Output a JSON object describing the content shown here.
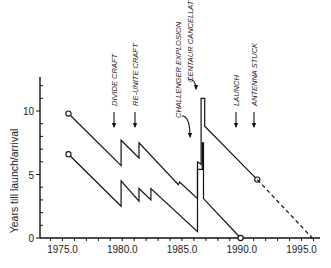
{
  "chart_data": {
    "type": "line",
    "title": "",
    "xlabel": "",
    "ylabel": "Years till launch/arrival",
    "xlim": [
      1973.5,
      1997.0
    ],
    "ylim": [
      0,
      12
    ],
    "x_ticks": [
      "1975.0",
      "1980.0",
      "1985.0",
      "1990.0",
      "1995.0"
    ],
    "x_tick_values": [
      1975,
      1980,
      1985,
      1990,
      1995
    ],
    "y_ticks": [
      "0",
      "5",
      "10"
    ],
    "y_tick_values": [
      0,
      5,
      10
    ],
    "grid": false,
    "legend": null,
    "series": [
      {
        "name": "upper (years till arrival)",
        "style": "solid",
        "points": [
          [
            1975.5,
            9.8
          ],
          [
            1979.9,
            5.7
          ],
          [
            1979.9,
            7.7
          ],
          [
            1981.4,
            6.3
          ],
          [
            1981.4,
            7.5
          ],
          [
            1984.7,
            4.2
          ],
          [
            1984.8,
            4.4
          ],
          [
            1986.3,
            3.1
          ],
          [
            1986.3,
            6.0
          ],
          [
            1986.6,
            5.8
          ],
          [
            1986.6,
            11.0
          ],
          [
            1986.9,
            11.0
          ],
          [
            1986.9,
            8.8
          ],
          [
            1991.3,
            4.6
          ]
        ],
        "markers": [
          [
            1975.5,
            9.8
          ],
          [
            1991.3,
            4.6
          ]
        ]
      },
      {
        "name": "upper projection",
        "style": "dashed",
        "points": [
          [
            1991.3,
            4.6
          ],
          [
            1995.9,
            0.0
          ]
        ]
      },
      {
        "name": "lower (years till launch)",
        "style": "solid",
        "points": [
          [
            1975.5,
            6.6
          ],
          [
            1979.9,
            2.5
          ],
          [
            1979.9,
            4.5
          ],
          [
            1981.4,
            2.9
          ],
          [
            1981.4,
            3.9
          ],
          [
            1982.4,
            3.0
          ],
          [
            1982.4,
            3.9
          ],
          [
            1986.3,
            0.5
          ],
          [
            1986.3,
            5.4
          ],
          [
            1986.7,
            5.4
          ],
          [
            1986.7,
            7.5
          ],
          [
            1986.8,
            7.5
          ],
          [
            1986.8,
            3.1
          ],
          [
            1989.9,
            0.0
          ]
        ],
        "markers": [
          [
            1975.5,
            6.6
          ],
          [
            1989.9,
            0.0
          ]
        ]
      }
    ],
    "annotations": [
      {
        "text": "DIVIDE CRAFT",
        "x": 1979.9,
        "arrow": "down"
      },
      {
        "text": "RE-UNITE CRAFT",
        "x": 1981.4,
        "arrow": "down"
      },
      {
        "text": "CHALLENGER EXPLOSION",
        "x": 1986.1,
        "arrow": "curved-down"
      },
      {
        "text": "CENTAUR CANCELLATION",
        "x": 1986.6,
        "arrow": "curved-down"
      },
      {
        "text": "LAUNCH",
        "x": 1989.8,
        "arrow": "down"
      },
      {
        "text": "ANTENNA STUCK",
        "x": 1991.3,
        "arrow": "down"
      }
    ]
  }
}
